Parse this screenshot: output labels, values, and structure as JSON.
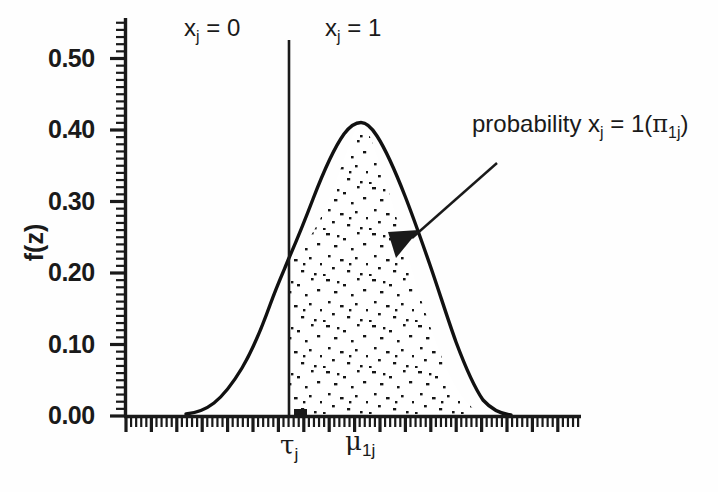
{
  "chart_data": {
    "type": "line",
    "title": "",
    "subtitle": "",
    "xlabel": "",
    "ylabel": "f(z)",
    "ylim": [
      0.0,
      0.54
    ],
    "xlim": [
      -4.35,
      4.35
    ],
    "grid": false,
    "legend_position": "none",
    "y_tick_labels": [
      "0.00",
      "0.10",
      "0.20",
      "0.30",
      "0.40",
      "0.50"
    ],
    "y_tick_values": [
      0.0,
      0.1,
      0.2,
      0.3,
      0.4,
      0.5
    ],
    "y_minor_ticks_per_major": 10,
    "x_minor_ticks_per_major": 5,
    "x_axis_tick_labels": [],
    "series": [
      {
        "name": "standard normal density f(z)",
        "formula": "f(z) = (1/sqrt(2*pi)) * exp(-z^2/2)",
        "peak_x": 0.0,
        "peak_y": 0.3989,
        "values_at": {
          "-3.0": 0.0044,
          "-2.5": 0.0175,
          "-2.0": 0.054,
          "-1.5": 0.1295,
          "-1.0": 0.242,
          "-0.5": 0.3521,
          "0.0": 0.3989,
          "0.5": 0.3521,
          "1.0": 0.242,
          "1.5": 0.1295,
          "2.0": 0.054,
          "2.5": 0.0175,
          "3.0": 0.0044
        }
      }
    ],
    "shaded_region": {
      "fill_style": "stipple-dots",
      "from_x": -0.82,
      "to_x": 4.0,
      "meaning": "probability that x_j = 1",
      "density_value_at_threshold": 0.2853
    },
    "threshold_line": {
      "x": -0.82,
      "label": "tau_j",
      "style": "solid vertical"
    },
    "mean_marker": {
      "x": 0.0,
      "label": "mu_1j"
    },
    "annotations": [
      {
        "name": "left-region",
        "text_plain": "x_j = 0",
        "x": -2.5,
        "y": 0.52
      },
      {
        "name": "right-region",
        "text_plain": "x_j = 1",
        "x": -0.1,
        "y": 0.52
      },
      {
        "name": "probability-callout",
        "text_plain": "probability x_j = 1(pi_1j)",
        "arrow_from_x": 2.45,
        "arrow_from_y": 0.385,
        "arrow_to_x": 0.88,
        "arrow_to_y": 0.233
      }
    ]
  },
  "axes": {
    "y_label": "f(z)",
    "y_ticks": [
      {
        "label": "0.50"
      },
      {
        "label": "0.40"
      },
      {
        "label": "0.30"
      },
      {
        "label": "0.20"
      },
      {
        "label": "0.10"
      },
      {
        "label": "0.00"
      }
    ],
    "x_tick_marks": {
      "tau": {
        "symbol": "τ",
        "sub": "j"
      },
      "mu": {
        "symbol": "μ",
        "sub": "1j"
      }
    }
  },
  "labels": {
    "region_left": {
      "var": "x",
      "sub": "j",
      "eq": " = 0"
    },
    "region_right": {
      "var": "x",
      "sub": "j",
      "eq": " = 1"
    },
    "callout": {
      "word": "probability ",
      "var": "x",
      "sub": "j",
      "eq": " = 1(",
      "pi": "π",
      "pi_sub": "1j",
      "close": ")"
    }
  },
  "colors": {
    "background": "#fefefe",
    "ink": "#1a1a1a",
    "curve": "#111111",
    "stipple": "#151515"
  }
}
